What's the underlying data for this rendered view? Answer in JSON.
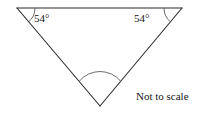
{
  "figure": {
    "name": "triangle-angle-diagram",
    "background_color": "#ffffff",
    "stroke_color": "#2b2b2b",
    "text_color": "#161616",
    "stroke_width": 1,
    "canvas": {
      "width": 206,
      "height": 114
    },
    "shape": {
      "type": "triangle",
      "orientation": "inverted",
      "vertices": [
        {
          "id": "top-left",
          "x": 17,
          "y": 8
        },
        {
          "id": "top-right",
          "x": 182,
          "y": 8
        },
        {
          "id": "bottom",
          "x": 100,
          "y": 106
        }
      ],
      "edges": [
        {
          "id": "top-edge",
          "from": "top-left",
          "to": "top-right"
        },
        {
          "id": "left-edge",
          "from": "top-left",
          "to": "bottom"
        },
        {
          "id": "right-edge",
          "from": "top-right",
          "to": "bottom"
        }
      ]
    },
    "angles": [
      {
        "id": "angle-top-left",
        "vertex": "top-left",
        "label": "54°",
        "value": 54,
        "unit": "degrees",
        "has_arc_marker": true,
        "labeled": true
      },
      {
        "id": "angle-top-right",
        "vertex": "top-right",
        "label": "54°",
        "value": 54,
        "unit": "degrees",
        "has_arc_marker": true,
        "labeled": true
      },
      {
        "id": "angle-bottom",
        "vertex": "bottom",
        "label": "",
        "value": null,
        "unit": "degrees",
        "has_arc_marker": true,
        "labeled": false
      }
    ],
    "note": "Not to scale"
  }
}
